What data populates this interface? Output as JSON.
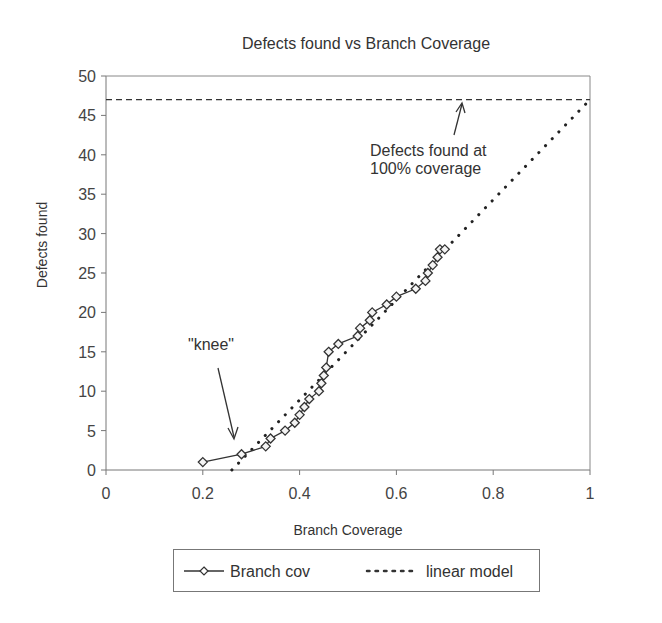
{
  "chart_data": {
    "type": "line",
    "title": "Defects found vs Branch Coverage",
    "xlabel": "Branch Coverage",
    "ylabel": "Defects found",
    "xlim": [
      0,
      1
    ],
    "ylim": [
      0,
      50
    ],
    "x_ticks": [
      "0",
      "0.2",
      "0.4",
      "0.6",
      "0.8",
      "1"
    ],
    "y_ticks": [
      "0",
      "5",
      "10",
      "15",
      "20",
      "25",
      "30",
      "35",
      "40",
      "45",
      "50"
    ],
    "grid": false,
    "legend_position": "bottom",
    "series": [
      {
        "name": "Branch cov",
        "style": "solid line with diamond markers",
        "x": [
          0.2,
          0.28,
          0.33,
          0.34,
          0.37,
          0.39,
          0.4,
          0.41,
          0.42,
          0.44,
          0.445,
          0.45,
          0.455,
          0.46,
          0.48,
          0.52,
          0.525,
          0.545,
          0.55,
          0.58,
          0.6,
          0.64,
          0.66,
          0.665,
          0.675,
          0.685,
          0.69,
          0.7
        ],
        "y": [
          1,
          2,
          3,
          4,
          5,
          6,
          7,
          8,
          9,
          10,
          11,
          12,
          13,
          15,
          16,
          17,
          18,
          19,
          20,
          21,
          22,
          23,
          24,
          25,
          26,
          27,
          28,
          28
        ]
      },
      {
        "name": "linear model",
        "style": "dotted line",
        "x": [
          0.26,
          1.0
        ],
        "y": [
          0,
          47
        ]
      }
    ],
    "reference_line": {
      "type": "horizontal dashed",
      "y": 47
    },
    "annotations": [
      {
        "text": "Defects found at 100% coverage",
        "points_to": {
          "x": 0.73,
          "y": 47
        }
      },
      {
        "text": "\"knee\"",
        "points_to": {
          "x": 0.27,
          "y": 4
        }
      }
    ]
  },
  "labels": {
    "title": "Defects found vs Branch Coverage",
    "xlabel": "Branch Coverage",
    "ylabel": "Defects found",
    "annot_100_line1": "Defects found at",
    "annot_100_line2": "100% coverage",
    "annot_knee": "\"knee\"",
    "legend_series1": "Branch cov",
    "legend_series2": "linear model"
  }
}
